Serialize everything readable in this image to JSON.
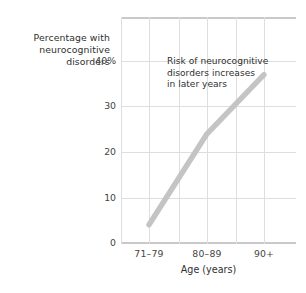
{
  "chart_data": {
    "type": "line",
    "title": "",
    "xlabel": "Age (years)",
    "ylabel": "Percentage with neurocognitive disorders",
    "ylabel_lines": [
      "Percentage with",
      "neurocognitive",
      "disorders"
    ],
    "categories": [
      "71–79",
      "80–89",
      "90+"
    ],
    "values": [
      4,
      24,
      37
    ],
    "series": [
      {
        "name": "Percentage with neurocognitive disorders",
        "values": [
          4,
          24,
          37
        ],
        "color": "#c4c4c4"
      }
    ],
    "ylim": [
      0,
      43
    ],
    "yticks": [
      0,
      10,
      20,
      30,
      40
    ],
    "ytick_labels": [
      "0",
      "10",
      "20",
      "30",
      "40%"
    ],
    "xtick_labels": [
      "71–79",
      "80–89",
      "90+"
    ],
    "grid": true,
    "legend": "none",
    "annotations": [
      {
        "text": "Risk of neurocognitive disorders increases in later years",
        "lines": [
          "Risk of neurocognitive",
          "disorders increases",
          "in later years"
        ]
      }
    ],
    "colors": {
      "line": "#c4c4c4",
      "grid": "#dedede",
      "axis": "#c9c9c9",
      "text": "#2f2f2f"
    }
  }
}
